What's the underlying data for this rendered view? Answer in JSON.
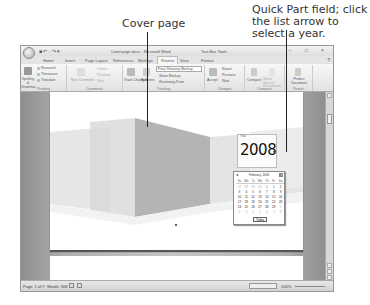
{
  "callouts": {
    "cover_page": "Cover page",
    "quick_part": "Quick Part field; click the list arrow to select a year."
  },
  "window": {
    "title": "Coverpage.docx - Microsoft Word",
    "contextual_tab": "Text Box Tools",
    "quick_access": "■ ↶ · ↷ ▾",
    "window_controls": "– □ ×"
  },
  "tabs": [
    "Home",
    "Insert",
    "Page Layout",
    "References",
    "Mailings",
    "Review",
    "View",
    "Format"
  ],
  "active_tab": "Review",
  "ribbon": {
    "groups": [
      {
        "label": "Proofing",
        "items": [
          "Spelling & Grammar",
          "Research",
          "Thesaurus",
          "Translate"
        ]
      },
      {
        "label": "Comments",
        "items": [
          "New Comment",
          "Delete",
          "Previous",
          "Next"
        ]
      },
      {
        "label": "Tracking",
        "items": [
          "Track Changes",
          "Balloons",
          "Final Showing Markup",
          "Show Markup",
          "Reviewing Pane"
        ]
      },
      {
        "label": "Changes",
        "items": [
          "Accept",
          "Reject",
          "Previous",
          "Next"
        ]
      },
      {
        "label": "Compare",
        "items": [
          "Compare",
          "Show Source Documents"
        ]
      },
      {
        "label": "Protect",
        "items": [
          "Protect Document"
        ]
      }
    ]
  },
  "document": {
    "year_label": "Year",
    "year_value": "2008",
    "year_arrow": "▾"
  },
  "calendar": {
    "month_title": "February, 2008",
    "prev": "◂",
    "next": "▸",
    "weekdays": [
      "Su",
      "Mo",
      "Tu",
      "We",
      "Th",
      "Fr",
      "Sa"
    ],
    "weeks": [
      [
        "27",
        "28",
        "29",
        "30",
        "31",
        "1",
        "2"
      ],
      [
        "3",
        "4",
        "5",
        "6",
        "7",
        "8",
        "9"
      ],
      [
        "10",
        "11",
        "12",
        "13",
        "14",
        "15",
        "16"
      ],
      [
        "17",
        "18",
        "19",
        "20",
        "21",
        "22",
        "23"
      ],
      [
        "24",
        "25",
        "26",
        "27",
        "28",
        "29",
        "1"
      ],
      [
        "2",
        "3",
        "4",
        "5",
        "6",
        "7",
        "8"
      ]
    ],
    "today_label": "Today"
  },
  "status": {
    "page": "Page: 1 of 7",
    "words": "Words: 308",
    "zoom": "100%"
  }
}
